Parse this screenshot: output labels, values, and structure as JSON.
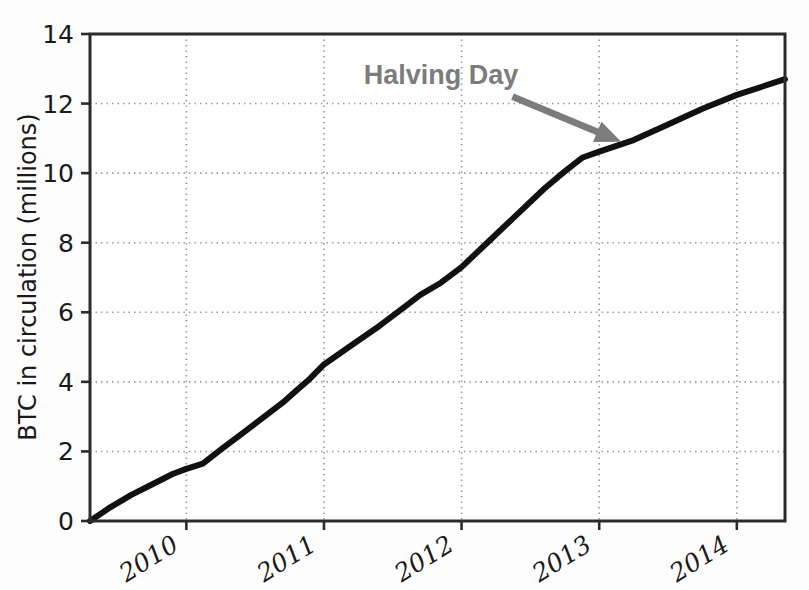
{
  "chart_data": {
    "type": "line",
    "title": "",
    "xlabel": "",
    "ylabel": "BTC in circulation (millions)",
    "xlim": [
      2009.3,
      2014.35
    ],
    "ylim": [
      0,
      14
    ],
    "grid": true,
    "legend": null,
    "xticks": [
      "2010",
      "2011",
      "2012",
      "2013",
      "2014"
    ],
    "xtick_values": [
      2010,
      2011,
      2012,
      2013,
      2014
    ],
    "yticks": [
      "0",
      "2",
      "4",
      "6",
      "8",
      "10",
      "12",
      "14"
    ],
    "ytick_values": [
      0,
      2,
      4,
      6,
      8,
      10,
      12,
      14
    ],
    "series": [
      {
        "name": "BTC in circulation",
        "color": "#111111",
        "linewidth": 6,
        "x": [
          2009.3,
          2009.45,
          2009.6,
          2009.75,
          2009.9,
          2010.0,
          2010.12,
          2010.25,
          2010.4,
          2010.55,
          2010.7,
          2010.8,
          2010.9,
          2011.0,
          2011.2,
          2011.4,
          2011.55,
          2011.7,
          2011.85,
          2012.0,
          2012.2,
          2012.4,
          2012.6,
          2012.75,
          2012.88,
          2013.0,
          2013.25,
          2013.5,
          2013.75,
          2014.0,
          2014.35
        ],
        "y": [
          0.0,
          0.4,
          0.75,
          1.05,
          1.35,
          1.5,
          1.65,
          2.05,
          2.5,
          2.95,
          3.4,
          3.75,
          4.1,
          4.5,
          5.05,
          5.6,
          6.05,
          6.5,
          6.85,
          7.3,
          8.05,
          8.8,
          9.55,
          10.05,
          10.45,
          10.62,
          10.95,
          11.4,
          11.85,
          12.25,
          12.7
        ]
      }
    ],
    "annotations": [
      {
        "text": "Halving Day",
        "text_x": 2011.85,
        "text_y": 12.55,
        "color": "#7c7c7c",
        "arrow": {
          "from_x": 2012.37,
          "from_y": 12.2,
          "to_x": 2013.16,
          "to_y": 10.9
        }
      }
    ]
  },
  "axes": {
    "frame_color": "#2b2b2b",
    "gridline_color": "#9a9a9a",
    "background": "#ffffff"
  }
}
